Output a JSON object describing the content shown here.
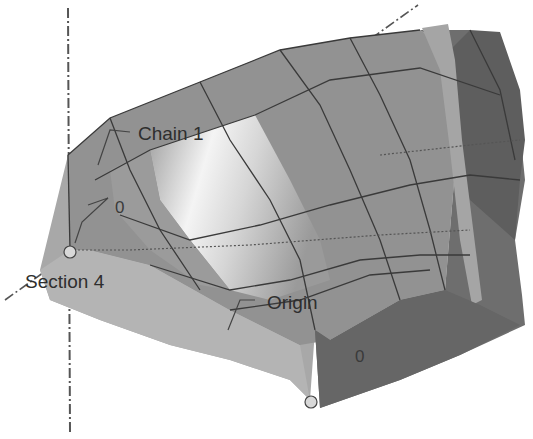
{
  "view": {
    "type": "CAD 3D surface model (lofted multi-section surface)",
    "background": "#ffffff"
  },
  "labels": {
    "chain": "Chain 1",
    "section": "Section 4",
    "origin": "Origin",
    "zero_a": "0",
    "zero_b": "0"
  },
  "colors": {
    "surface_light": "#a9a9a9",
    "surface_mid": "#8e8e8e",
    "surface_dark": "#6c6c6c",
    "surface_highlight": "#f2f2f2",
    "edge_lines": "#3a3a3a",
    "axis_lines": "#555555",
    "point_fill": "#d8d8d8"
  }
}
